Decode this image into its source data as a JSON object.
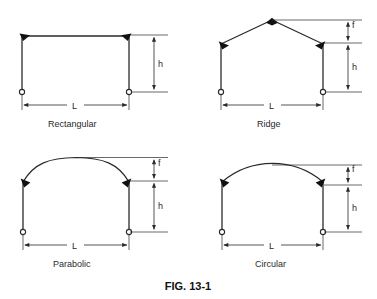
{
  "figure": {
    "caption": "FIG. 13-1",
    "background_color": "#ffffff",
    "line_color": "#2a2a2a",
    "joint_color": "#111111"
  },
  "dimension_symbols": {
    "span": "L",
    "eave_height": "h",
    "rise": "f"
  },
  "frames": [
    {
      "id": "rectangular",
      "label": "Rectangular",
      "roof_type": "flat",
      "has_rise_dimension": false,
      "dimensions": [
        "L",
        "h"
      ]
    },
    {
      "id": "ridge",
      "label": "Ridge",
      "roof_type": "gable",
      "has_rise_dimension": true,
      "dimensions": [
        "L",
        "h",
        "f"
      ]
    },
    {
      "id": "parabolic",
      "label": "Parabolic",
      "roof_type": "parabolic-arch",
      "has_rise_dimension": true,
      "dimensions": [
        "L",
        "h",
        "f"
      ]
    },
    {
      "id": "circular",
      "label": "Circular",
      "roof_type": "circular-arch",
      "has_rise_dimension": true,
      "dimensions": [
        "L",
        "h",
        "f"
      ]
    }
  ]
}
